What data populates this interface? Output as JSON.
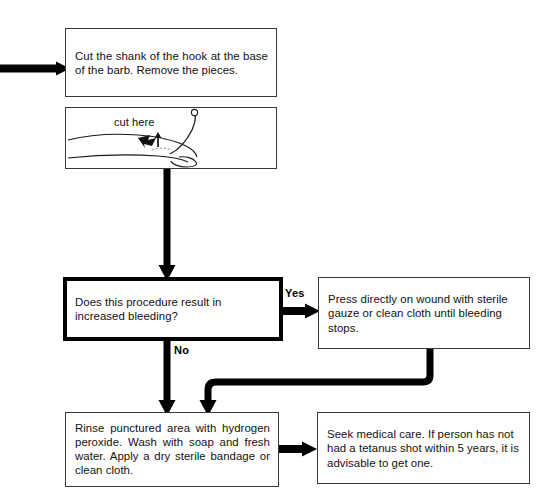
{
  "diagram": {
    "type": "flowchart",
    "background": "#ffffff",
    "line_color": "#000000",
    "box_border_color": "#3a3a3a"
  },
  "nodes": {
    "cut_shank": {
      "id": "cut-shank-step",
      "text": "Cut the shank of the hook at the base of the barb. Remove the pieces.",
      "shape": "rectangle"
    },
    "illustration": {
      "id": "hook-illustration",
      "caption": "cut here",
      "shape": "rectangle",
      "depicts": "finger with embedded fishhook and arrow marking cut point"
    },
    "decision_bleeding": {
      "id": "bleeding-decision",
      "text": "Does this procedure result in increased bleeding?",
      "shape": "decision",
      "emphasis": "thick-border"
    },
    "press_wound": {
      "id": "press-wound-step",
      "text": "Press directly on wound with sterile gauze or clean cloth until bleeding stops.",
      "shape": "rectangle"
    },
    "rinse_area": {
      "id": "rinse-area-step",
      "text": "Rinse punctured area with hydrogen peroxide. Wash with soap and fresh water. Apply a dry sterile bandage or clean cloth.",
      "shape": "rectangle"
    },
    "seek_care": {
      "id": "seek-care-step",
      "text": "Seek medical care. If person has not had a tetanus shot within 5 years, it is advisable to get one.",
      "shape": "rectangle"
    }
  },
  "edge_labels": {
    "yes": "Yes",
    "no": "No"
  },
  "connectors": [
    {
      "name": "entry-arrow",
      "from": "off-page-left",
      "to": "cut_shank",
      "direction": "right"
    },
    {
      "name": "illustration-to-decision",
      "from": "illustration",
      "to": "decision_bleeding",
      "direction": "down"
    },
    {
      "name": "decision-yes-to-press",
      "from": "decision_bleeding",
      "to": "press_wound",
      "direction": "right",
      "label": "Yes"
    },
    {
      "name": "decision-no-to-rinse",
      "from": "decision_bleeding",
      "to": "rinse_area",
      "direction": "down",
      "label": "No"
    },
    {
      "name": "press-to-rinse",
      "from": "press_wound",
      "to": "rinse_area",
      "direction": "down-left-down"
    },
    {
      "name": "rinse-to-seek-care",
      "from": "rinse_area",
      "to": "seek_care",
      "direction": "right"
    }
  ]
}
